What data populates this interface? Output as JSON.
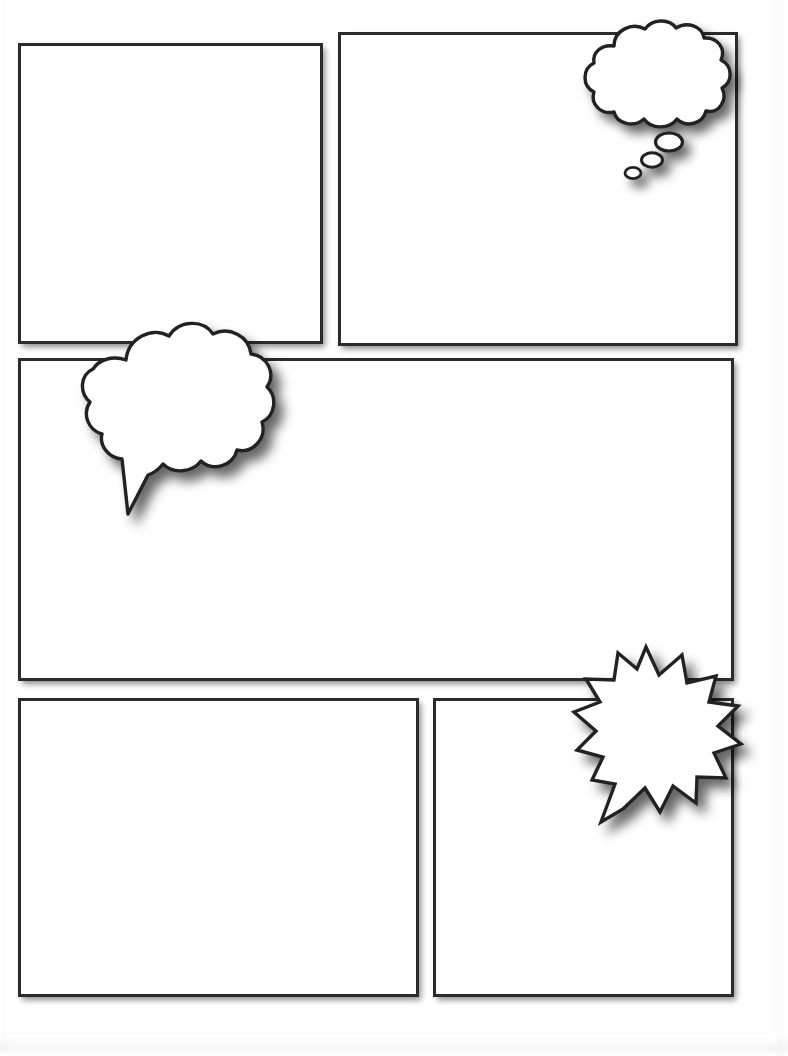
{
  "page": {
    "background_color": "#ffffff",
    "width": 788,
    "height": 1056,
    "ink_color": "#2b2b2b",
    "fill_color": "#ffffff"
  },
  "panels": [
    {
      "id": "panel-top-left",
      "label": "Panel 1",
      "row": "top",
      "position": "left",
      "x": 18,
      "y": 43,
      "width": 305,
      "height": 301,
      "content": "",
      "border_color": "#2b2b2b",
      "fill_color": "#ffffff"
    },
    {
      "id": "panel-top-right",
      "label": "Panel 2",
      "row": "top",
      "position": "right",
      "x": 338,
      "y": 32,
      "width": 400,
      "height": 314,
      "content": "",
      "border_color": "#2b2b2b",
      "fill_color": "#ffffff"
    },
    {
      "id": "panel-middle-wide",
      "label": "Panel 3",
      "row": "middle",
      "position": "full-width",
      "x": 18,
      "y": 358,
      "width": 716,
      "height": 323,
      "content": "",
      "border_color": "#2b2b2b",
      "fill_color": "#ffffff"
    },
    {
      "id": "panel-bottom-left",
      "label": "Panel 4",
      "row": "bottom",
      "position": "left",
      "x": 18,
      "y": 698,
      "width": 401,
      "height": 299,
      "content": "",
      "border_color": "#2b2b2b",
      "fill_color": "#ffffff"
    },
    {
      "id": "panel-bottom-right",
      "label": "Panel 5",
      "row": "bottom",
      "position": "right",
      "x": 433,
      "y": 698,
      "width": 301,
      "height": 299,
      "content": "",
      "border_color": "#2b2b2b",
      "fill_color": "#ffffff"
    }
  ],
  "balloons": [
    {
      "id": "thought-bubble",
      "type": "thought",
      "icon": "thought-bubble-icon",
      "anchored_panel": "panel-top-right",
      "x": 556,
      "y": 20,
      "width": 180,
      "height": 170,
      "text": "",
      "tail": "trailing-ovals",
      "tail_direction": "down-left",
      "tail_bubble_count": 3,
      "lobe_count": 9,
      "fill_color": "#ffffff",
      "stroke_color": "#222222"
    },
    {
      "id": "cloud-speech-bubble",
      "type": "speech-cloud",
      "icon": "speech-cloud-icon",
      "anchored_panel": "panel-middle-wide",
      "x": 66,
      "y": 308,
      "width": 222,
      "height": 212,
      "text": "",
      "tail": "pointed-spike",
      "tail_direction": "down-left",
      "lobe_count": 10,
      "fill_color": "#ffffff",
      "stroke_color": "#222222"
    },
    {
      "id": "burst-bubble",
      "type": "burst",
      "icon": "starburst-bubble-icon",
      "anchored_panel": "panel-bottom-right",
      "x": 560,
      "y": 636,
      "width": 190,
      "height": 190,
      "text": "",
      "tail": "pointed-spike",
      "tail_direction": "down-left",
      "point_count": 12,
      "fill_color": "#ffffff",
      "stroke_color": "#222222"
    }
  ]
}
